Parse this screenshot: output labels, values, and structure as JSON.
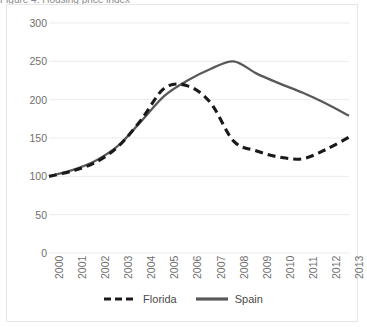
{
  "caption": {
    "fragment": "Figure 4. Housing price index"
  },
  "chart_data": {
    "type": "line",
    "title": "",
    "subtitle": "",
    "xlabel": "",
    "ylabel": "",
    "categories": [
      "2000",
      "2001",
      "2002",
      "2003",
      "2004",
      "2005",
      "2006",
      "2007",
      "2008",
      "2009",
      "2010",
      "2011",
      "2012",
      "2013"
    ],
    "series": [
      {
        "name": "Florida",
        "style": "dashed",
        "color": "#1a1a1a",
        "values": [
          100,
          107,
          118,
          139,
          174,
          215,
          218,
          196,
          146,
          133,
          125,
          123,
          135,
          151
        ]
      },
      {
        "name": "Spain",
        "style": "solid",
        "color": "#595959",
        "values": [
          100,
          108,
          120,
          140,
          172,
          205,
          225,
          240,
          250,
          234,
          221,
          209,
          195,
          179
        ]
      }
    ],
    "yticks": [
      0,
      50,
      100,
      150,
      200,
      250,
      300
    ],
    "ylim": [
      0,
      300
    ],
    "xlim": [
      "2000",
      "2013"
    ],
    "grid": "horizontal",
    "legend_position": "bottom",
    "gridline_color": "#ebebeb",
    "axis_text_color": "#6f6f6f",
    "border_color": "#e6e6e6",
    "background": "#ffffff"
  },
  "legend": {
    "items": [
      {
        "label": "Florida",
        "icon": "dashed-line-swatch"
      },
      {
        "label": "Spain",
        "icon": "solid-line-swatch"
      }
    ]
  }
}
